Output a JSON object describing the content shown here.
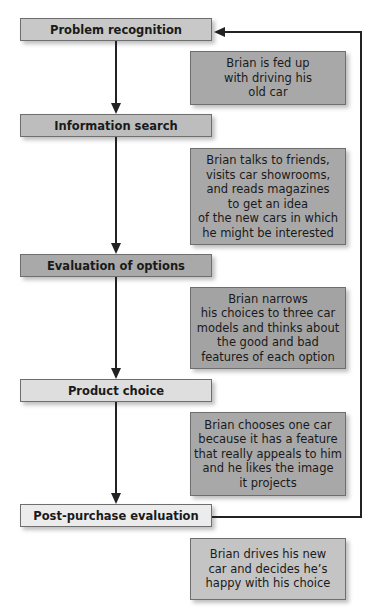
{
  "diagram": {
    "type": "flowchart",
    "steps": [
      {
        "label": "Problem recognition",
        "color": "#c8c8c8"
      },
      {
        "label": "Information search",
        "color": "#bdbdbd"
      },
      {
        "label": "Evaluation of options",
        "color": "#a9a9a9"
      },
      {
        "label": "Product choice",
        "color": "#dedede"
      },
      {
        "label": "Post-purchase evaluation",
        "color": "#ececec"
      }
    ],
    "descriptions": [
      {
        "text": "Brian is fed up\nwith driving his\nold car",
        "color": "#a8a8a8"
      },
      {
        "text": "Brian talks to friends,\nvisits car showrooms,\nand reads magazines\nto get an idea\nof the new cars in which\nhe might be interested",
        "color": "#a8a8a8"
      },
      {
        "text": "Brian narrows\nhis choices to three car\nmodels and thinks about\nthe good and bad\nfeatures of each option",
        "color": "#a3a3a3"
      },
      {
        "text": "Brian chooses one car\nbecause it has a feature\nthat really appeals to him\nand he likes the image\nit projects",
        "color": "#a8a8a8"
      },
      {
        "text": "Brian drives his new\ncar and decides he’s\nhappy with his choice",
        "color": "#c4c4c4"
      }
    ],
    "feedback_loop": {
      "from": "Post-purchase evaluation",
      "to": "Problem recognition"
    }
  }
}
